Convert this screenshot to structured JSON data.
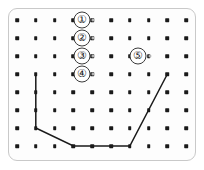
{
  "figure": {
    "kind": "dot-grid-geoboard",
    "title": "",
    "frame": {
      "border_color": "#c9c9c9",
      "fill_color": "#fdfdfd",
      "corner_radius": 9
    },
    "grid": {
      "columns": 10,
      "rows": 8,
      "origin_x": 17,
      "origin_y": 20,
      "step_x": 18.8,
      "step_y": 18.0,
      "dot_color": "#1a1a1a",
      "dot_size": 3.6
    },
    "markers": [
      {
        "label": "①",
        "name": "marker-1",
        "col": 4.45,
        "row": 1
      },
      {
        "label": "②",
        "name": "marker-2",
        "col": 4.45,
        "row": 2
      },
      {
        "label": "③",
        "name": "marker-3",
        "col": 4.45,
        "row": 3
      },
      {
        "label": "④",
        "name": "marker-4",
        "col": 4.45,
        "row": 4
      },
      {
        "label": "⑤",
        "name": "marker-5",
        "col": 7.45,
        "row": 3
      }
    ],
    "faded_dots": [
      {
        "col": 5.05,
        "row": 1
      },
      {
        "col": 5.05,
        "row": 2
      },
      {
        "col": 5.05,
        "row": 3
      },
      {
        "col": 5.05,
        "row": 4
      },
      {
        "col": 8.05,
        "row": 3
      }
    ],
    "path": {
      "name": "drawn-polyline",
      "stroke_color": "#1a1a1a",
      "stroke_width": 1.5,
      "points": [
        {
          "col": 2,
          "row": 4
        },
        {
          "col": 2,
          "row": 7
        },
        {
          "col": 4,
          "row": 8
        },
        {
          "col": 7,
          "row": 8
        },
        {
          "col": 9,
          "row": 4
        }
      ]
    }
  }
}
